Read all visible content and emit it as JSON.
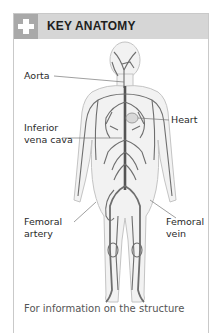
{
  "section": {
    "icon": "plus-cross-icon",
    "title": "KEY ANATOMY",
    "colors": {
      "header_bg": "#d6d6d6",
      "icon_bg": "#a9a9a9",
      "border": "#c9c9c9"
    }
  },
  "figure": {
    "labels": [
      {
        "text_lines": [
          "Aorta"
        ]
      },
      {
        "text_lines": [
          "Heart"
        ]
      },
      {
        "text_lines": [
          "Inferior",
          "vena cava"
        ]
      },
      {
        "text_lines": [
          "Femoral",
          "artery"
        ]
      },
      {
        "text_lines": [
          "Femoral",
          "vein"
        ]
      }
    ]
  },
  "caption": "For information on the structure"
}
